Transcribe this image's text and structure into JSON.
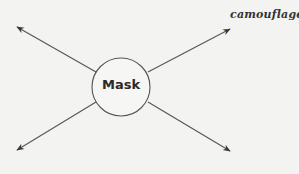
{
  "diagram": {
    "center": {
      "label": "Mask"
    },
    "branches": [
      {
        "position": "top-left",
        "label": ""
      },
      {
        "position": "top-right",
        "label": "camouflage"
      },
      {
        "position": "bottom-left",
        "label": ""
      },
      {
        "position": "bottom-right",
        "label": ""
      }
    ]
  }
}
